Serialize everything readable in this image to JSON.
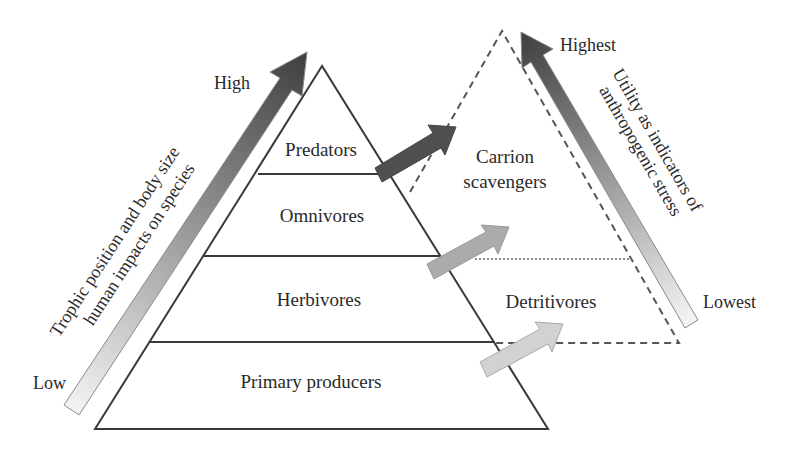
{
  "diagram": {
    "type": "trophic-pyramid",
    "pyramid_levels": [
      {
        "label": "Predators"
      },
      {
        "label": "Omnivores"
      },
      {
        "label": "Herbivores"
      },
      {
        "label": "Primary producers"
      }
    ],
    "scavenger_levels": [
      {
        "label_line1": "Carrion",
        "label_line2": "scavengers"
      },
      {
        "label": "Detritivores"
      }
    ],
    "left_axis": {
      "label_line1": "Trophic position and body size",
      "label_line2": "human impacts on species",
      "high_label": "High",
      "low_label": "Low"
    },
    "right_axis": {
      "label_line1": "Utility as indicators of",
      "label_line2": "anthropogenic stress",
      "high_label": "Highest",
      "low_label": "Lowest"
    },
    "colors": {
      "line": "#3a3a3a",
      "arrow_dark": "#4a4a4a",
      "arrow_mid": "#a8a8a8",
      "arrow_light": "#cfcfcf",
      "gradient_top": "#444444",
      "gradient_bottom": "#f2f2f2"
    }
  }
}
